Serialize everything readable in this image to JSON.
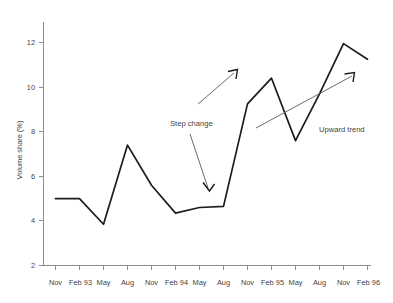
{
  "chart_data": {
    "type": "line",
    "title": "",
    "xlabel": "",
    "ylabel": "Volume share (%)",
    "ylim": [
      2,
      12.8
    ],
    "yticks": [
      2,
      4,
      6,
      8,
      10,
      12
    ],
    "ytick_labels": [
      "2",
      "4",
      "6",
      "8",
      "10",
      "12"
    ],
    "grid": false,
    "legend": "none",
    "categories": [
      "Nov",
      "Feb 93",
      "May",
      "Aug",
      "Nov",
      "Feb 94",
      "May",
      "Aug",
      "Nov",
      "Feb 95",
      "May",
      "Aug",
      "Nov",
      "Feb 96"
    ],
    "series": [
      {
        "name": "Volume share",
        "values": [
          5.0,
          5.0,
          3.85,
          7.4,
          5.6,
          4.35,
          4.6,
          4.65,
          9.25,
          10.4,
          7.6,
          9.7,
          11.95,
          11.25
        ]
      }
    ],
    "annotations": [
      {
        "text": "Step change",
        "kind": "arrow-label",
        "arrow_from": [
          3.05,
          4.2
        ],
        "arrow_to": [
          3.72,
          3.05
        ]
      },
      {
        "text": "Upward trend",
        "kind": "arrow-label",
        "arrow_from": [
          2.0,
          3.45
        ],
        "arrow_to": [
          4.15,
          5.2
        ]
      }
    ],
    "trend_arrows": [
      {
        "name": "step-change-up-arrow",
        "from": [
          6.0,
          7.9
        ],
        "to": [
          7.65,
          9.4
        ]
      },
      {
        "name": "upward-trend-arrow",
        "from": [
          8.3,
          8.05
        ],
        "to": [
          13.1,
          10.6
        ]
      }
    ]
  }
}
